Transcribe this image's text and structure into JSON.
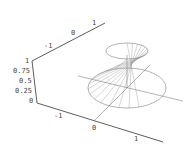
{
  "chart_data": {
    "type": "surface3d",
    "title": "",
    "axes": {
      "x": {
        "ticks": [
          "-1",
          "0",
          "1"
        ],
        "range": [
          -1.5,
          1.5
        ]
      },
      "y": {
        "ticks": [
          "-1",
          "0",
          "1"
        ],
        "range": [
          -1.5,
          1.5
        ]
      },
      "z": {
        "ticks": [
          "0",
          "0.25",
          "0.5",
          "0.75",
          "1"
        ],
        "range": [
          0,
          1
        ]
      }
    },
    "surface": {
      "top_circle": {
        "z": 1,
        "radius": 0.5
      },
      "bottom_circle": {
        "z": 0,
        "radius": 1
      },
      "rulings": 24
    },
    "grid": false,
    "legend": null
  },
  "labels": {
    "back_axis": [
      "-1",
      "0",
      "1"
    ],
    "z_axis": [
      "1",
      "0.75",
      "0.5",
      "0.25",
      "0"
    ],
    "front_axis": [
      "-1",
      "0",
      "1"
    ]
  },
  "colors": {
    "axis": "#333333",
    "surface": "#666666",
    "background": "#ffffff"
  }
}
